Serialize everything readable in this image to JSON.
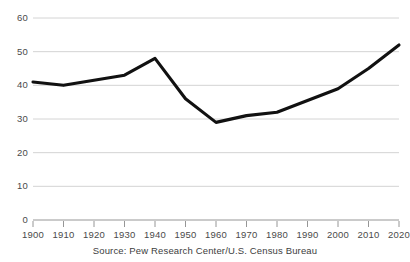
{
  "chart_data": {
    "type": "line",
    "title": "",
    "subtitle": "",
    "xlabel": "",
    "ylabel": "",
    "x": [
      1900,
      1910,
      1920,
      1930,
      1940,
      1950,
      1960,
      1970,
      1980,
      1990,
      2000,
      2010,
      2020
    ],
    "values": [
      41,
      40,
      41.5,
      43,
      48,
      36,
      29,
      31,
      32,
      35.5,
      39,
      45,
      52
    ],
    "series": [
      {
        "name": "",
        "values": [
          41,
          40,
          41.5,
          43,
          48,
          36,
          29,
          31,
          32,
          35.5,
          39,
          45,
          52
        ]
      }
    ],
    "x_tick_labels": [
      "1900",
      "1910",
      "1920",
      "1930",
      "1940",
      "1950",
      "1960",
      "1970",
      "1980",
      "1990",
      "2000",
      "2010",
      "2020"
    ],
    "y_tick_labels": [
      "0",
      "10",
      "20",
      "30",
      "40",
      "50",
      "60"
    ],
    "y_ticks": [
      0,
      10,
      20,
      30,
      40,
      50,
      60
    ],
    "xlim": [
      1900,
      2020
    ],
    "ylim": [
      0,
      60
    ],
    "grid": "horizontal",
    "legend": "none",
    "line_color": "#111111",
    "grid_color": "#cfcfcf",
    "axis_color": "#8a8a8a",
    "text_color": "#3d3d3d"
  },
  "caption": {
    "source": "Source: Pew Research Center/U.S. Census Bureau"
  }
}
